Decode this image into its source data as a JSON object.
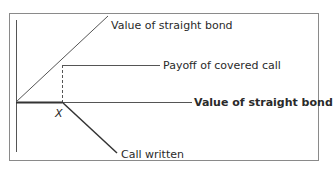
{
  "diagram": {
    "type": "payoff-diagram",
    "labels": {
      "straight_bond_diagonal": "Value of straight bond",
      "covered_call_payoff": "Payoff of covered call",
      "straight_bond_horizontal": "Value of straight bond",
      "strike": "X",
      "call_written": "Call written"
    },
    "colors": {
      "frame": "#8a8a8a",
      "line": "#3a3a3a",
      "text": "#2a2a2a"
    }
  }
}
